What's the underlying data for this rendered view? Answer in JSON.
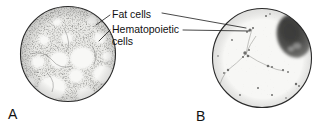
{
  "figure": {
    "background_color": "#ffffff",
    "ink_color": "#111111",
    "width": 330,
    "height": 127
  },
  "annotations": [
    {
      "id": "fat-cells",
      "label": "Fat cells",
      "x": 112,
      "y": 18,
      "lines": 1
    },
    {
      "id": "hematopoietic-cells",
      "label": "Hematopoietic",
      "label_line2": "cells",
      "x": 112,
      "y": 33,
      "lines": 2
    }
  ],
  "panels": [
    {
      "id": "panel-a",
      "letter": "A",
      "letter_x": 8,
      "letter_y": 119,
      "center_x": 68,
      "center_y": 54,
      "radius": 48,
      "description": "Dense speckled hematopoietic marrow with large pale round fat cell vacuoles",
      "fill_color": "#f2f2f0",
      "speckle_color": "#5a5a58",
      "vacuole_color": "#f7f7f5",
      "cellularity": "hypercellular"
    },
    {
      "id": "panel-b",
      "letter": "B",
      "letter_x": 196,
      "letter_y": 121,
      "center_x": 262,
      "center_y": 58,
      "radius": 50,
      "description": "Pale sparse marrow with a single large dark stained aggregate at upper right",
      "fill_color": "#f6f6f4",
      "speckle_color": "#8a8a88",
      "dark_blob_color": "#4a4a48",
      "cellularity": "hypocellular"
    }
  ],
  "colors": {
    "paper": "#ffffff",
    "ink": "#111111",
    "tissue_dark": "#4a4a48",
    "tissue_mid": "#7a7a78",
    "tissue_light": "#f2f2f0"
  }
}
